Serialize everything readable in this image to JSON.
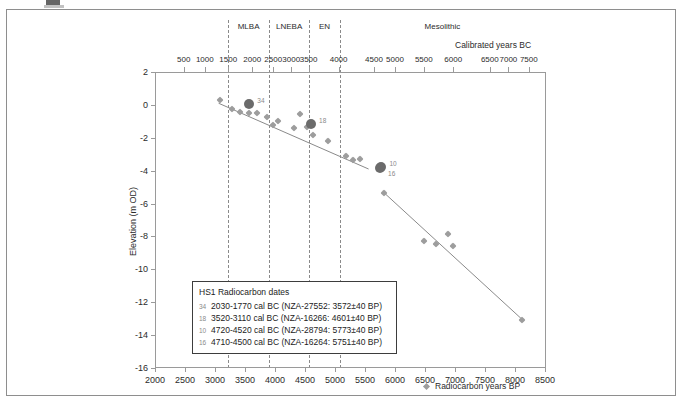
{
  "figure": {
    "caption_fragment": ""
  },
  "chart_data": {
    "type": "scatter",
    "title": "",
    "xlabel": "Radiocarbon years BP",
    "ylabel": "Elevation (m OD)",
    "top_axis_label": "Calibrated years BC",
    "xlim": [
      2000,
      8500
    ],
    "ylim": [
      -16,
      2
    ],
    "grid": false,
    "legend_position": "bottom-center",
    "x_ticks": [
      2000,
      2500,
      3000,
      3500,
      4000,
      4500,
      5000,
      5500,
      6000,
      6500,
      7000,
      7500,
      8000,
      8500
    ],
    "y_ticks": [
      2,
      0,
      -2,
      -4,
      -6,
      -8,
      -10,
      -12,
      -14,
      -16
    ],
    "top_ticks": [
      {
        "label": "500",
        "bp": 2480
      },
      {
        "label": "1000",
        "bp": 2830
      },
      {
        "label": "1500",
        "bp": 3220
      },
      {
        "label": "2000",
        "bp": 3620
      },
      {
        "label": "2500",
        "bp": 3970
      },
      {
        "label": "3000",
        "bp": 4270
      },
      {
        "label": "3500",
        "bp": 4560
      },
      {
        "label": "4000",
        "bp": 5060
      },
      {
        "label": "4500",
        "bp": 5650
      },
      {
        "label": "5000",
        "bp": 6000
      },
      {
        "label": "5500",
        "bp": 6480
      },
      {
        "label": "6000",
        "bp": 6970
      },
      {
        "label": "6500",
        "bp": 7580
      },
      {
        "label": "7000",
        "bp": 7890
      },
      {
        "label": "7500",
        "bp": 8230
      }
    ],
    "periods": [
      {
        "name": "MLBA",
        "start_bp": 3220,
        "end_bp": 3900
      },
      {
        "name": "LNEBA",
        "start_bp": 3900,
        "end_bp": 4570
      },
      {
        "name": "EN",
        "start_bp": 4570,
        "end_bp": 5080
      },
      {
        "name": "Mesolithic",
        "start_bp": 5080,
        "end_bp": 8500
      }
    ],
    "period_dividers_bp": [
      3220,
      3900,
      4570,
      5080
    ],
    "series": [
      {
        "name": "Radiocarbon years BP",
        "marker": "diamond",
        "color": "#9d9d9d",
        "points": [
          {
            "x": 3080,
            "y": 0.3
          },
          {
            "x": 3280,
            "y": -0.25
          },
          {
            "x": 3420,
            "y": -0.45
          },
          {
            "x": 3560,
            "y": -0.5
          },
          {
            "x": 3700,
            "y": -0.5
          },
          {
            "x": 3870,
            "y": -0.75
          },
          {
            "x": 3960,
            "y": -1.2
          },
          {
            "x": 4050,
            "y": -0.95
          },
          {
            "x": 4320,
            "y": -1.4
          },
          {
            "x": 4420,
            "y": -0.55
          },
          {
            "x": 4530,
            "y": -1.35
          },
          {
            "x": 4640,
            "y": -1.85
          },
          {
            "x": 4880,
            "y": -2.2
          },
          {
            "x": 5180,
            "y": -3.1
          },
          {
            "x": 5300,
            "y": -3.35
          },
          {
            "x": 5420,
            "y": -3.3
          },
          {
            "x": 5820,
            "y": -5.35
          },
          {
            "x": 6480,
            "y": -8.3
          },
          {
            "x": 6680,
            "y": -8.45
          },
          {
            "x": 6880,
            "y": -7.85
          },
          {
            "x": 6960,
            "y": -8.6
          },
          {
            "x": 8120,
            "y": -13.1
          }
        ]
      },
      {
        "name": "Dated samples",
        "marker": "circle",
        "color": "#6b6b6b",
        "points": [
          {
            "x": 3572,
            "y": 0.05,
            "index": "34"
          },
          {
            "x": 4601,
            "y": -1.15,
            "index": "18"
          },
          {
            "x": 5773,
            "y": -3.75,
            "index": "10"
          },
          {
            "x": 5751,
            "y": -3.85,
            "index": "16"
          }
        ]
      }
    ],
    "trend_lines": [
      {
        "x1": 3060,
        "y1": 0.1,
        "x2": 5560,
        "y2": -3.9
      },
      {
        "x1": 5820,
        "y1": -5.35,
        "x2": 8150,
        "y2": -13.15
      }
    ]
  },
  "info_box": {
    "title": "HS1 Radiocarbon dates",
    "rows": [
      {
        "index": "34",
        "text": "2030-1770 cal BC (NZA-27552: 3572±40 BP)"
      },
      {
        "index": "18",
        "text": "3520-3110 cal BC (NZA-16266: 4601±40 BP)"
      },
      {
        "index": "10",
        "text": "4720-4520 cal BC (NZA-28794: 5773±40 BP)"
      },
      {
        "index": "16",
        "text": "4710-4500 cal BC (NZA-16264: 5751±40 BP)"
      }
    ]
  },
  "series_legend": {
    "label": "Radiocarbon years BP"
  }
}
